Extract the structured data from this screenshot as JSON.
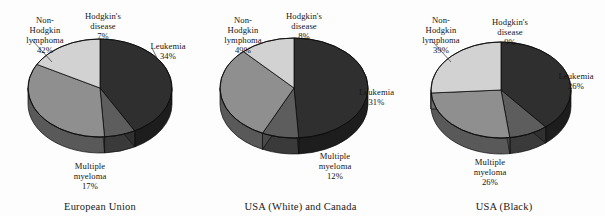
{
  "figure": {
    "background_color": "#fdfdfd",
    "text_color": "#151515"
  },
  "chart_data": [
    {
      "type": "pie",
      "title": "European Union",
      "style": "3d-pie",
      "labels": [
        "Non-Hodgkin lymphoma",
        "Hodgkin's disease",
        "Leukemia",
        "Multiple myeloma"
      ],
      "values": [
        42,
        7,
        34,
        17
      ],
      "value_suffix": "%",
      "colors": [
        "#2f2f2f",
        "#5d5d5d",
        "#8f8f8f",
        "#d2d2d2"
      ],
      "legend": "none",
      "annotations": [
        {
          "label": "Non-\nHodgkin\nlymphoma",
          "value": "42%"
        },
        {
          "label": "Hodgkin's\ndisease",
          "value": "7%"
        },
        {
          "label": "Leukemia",
          "value": "34%"
        },
        {
          "label": "Multiple\nmyeloma",
          "value": "17%"
        }
      ]
    },
    {
      "type": "pie",
      "title": "USA (White) and Canada",
      "style": "3d-pie",
      "labels": [
        "Non-Hodgkin lymphoma",
        "Hodgkin's disease",
        "Leukemia",
        "Multiple myeloma"
      ],
      "values": [
        49,
        8,
        31,
        12
      ],
      "value_suffix": "%",
      "colors": [
        "#2f2f2f",
        "#5d5d5d",
        "#8f8f8f",
        "#d2d2d2"
      ],
      "legend": "none",
      "annotations": [
        {
          "label": "Non-\nHodgkin\nlymphoma",
          "value": "49%"
        },
        {
          "label": "Hodgkin's\ndisease",
          "value": "8%"
        },
        {
          "label": "Leukemia",
          "value": "31%"
        },
        {
          "label": "Multiple\nmyeloma",
          "value": "12%"
        }
      ]
    },
    {
      "type": "pie",
      "title": "USA (Black)",
      "style": "3d-pie",
      "labels": [
        "Non-Hodgkin lymphoma",
        "Hodgkin's disease",
        "Leukemia",
        "Multiple myeloma"
      ],
      "values": [
        39,
        9,
        26,
        26
      ],
      "value_suffix": "%",
      "colors": [
        "#2f2f2f",
        "#5d5d5d",
        "#8f8f8f",
        "#d2d2d2"
      ],
      "legend": "none",
      "annotations": [
        {
          "label": "Non-\nHodgkin\nlymphoma",
          "value": "39%"
        },
        {
          "label": "Hodgkin's\ndisease",
          "value": "9%"
        },
        {
          "label": "Leukemia",
          "value": "26%"
        },
        {
          "label": "Multiple\nmyeloma",
          "value": "26%"
        }
      ]
    }
  ],
  "panels": [
    {
      "caption": "European Union",
      "labels": {
        "nhl": {
          "text": "Non-\nHodgkin\nlymphoma",
          "value": "42%"
        },
        "hodgkin": {
          "text": "Hodgkin's\ndisease",
          "value": "7%"
        },
        "leukemia": {
          "text": "Leukemia",
          "value": "34%"
        },
        "myeloma": {
          "text": "Multiple\nmyeloma",
          "value": "17%"
        }
      }
    },
    {
      "caption": "USA (White) and Canada",
      "labels": {
        "nhl": {
          "text": "Non-\nHodgkin\nlymphoma",
          "value": "49%"
        },
        "hodgkin": {
          "text": "Hodgkin's\ndisease",
          "value": "8%"
        },
        "leukemia": {
          "text": "Leukemia",
          "value": "31%"
        },
        "myeloma": {
          "text": "Multiple\nmyeloma",
          "value": "12%"
        }
      }
    },
    {
      "caption": "USA (Black)",
      "labels": {
        "nhl": {
          "text": "Non-\nHodgkin\nlymphoma",
          "value": "39%"
        },
        "hodgkin": {
          "text": "Hodgkin's\ndisease",
          "value": "9%"
        },
        "leukemia": {
          "text": "Leukemia",
          "value": "26%"
        },
        "myeloma": {
          "text": "Multiple\nmyeloma",
          "value": "26%"
        }
      }
    }
  ]
}
